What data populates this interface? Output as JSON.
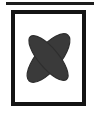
{
  "figure": {
    "title": "",
    "caption": "",
    "background_color": "#ffffff",
    "top_rule": {
      "name": "horizontal-rule",
      "color": "#1c1c1c",
      "x": 6,
      "y": 2,
      "width": 88,
      "height": 3
    },
    "frame": {
      "name": "icon-frame",
      "border_color": "#141414",
      "border_width": 4,
      "fill": "#ffffff",
      "x": 11,
      "y": 10,
      "width": 75,
      "height": 96
    },
    "icon": {
      "name": "cross-ellipses-icon",
      "description": "four-pointed cross formed by two overlapping rotated ellipses",
      "fill": "#3a3a3a",
      "stroke": "#2e2e2e",
      "center_x": 48,
      "center_y": 57,
      "ellipses": [
        {
          "label": "ellipse-nw-se",
          "cx": 48,
          "cy": 57,
          "rx": 12,
          "ry": 30,
          "rotation_deg": 40
        },
        {
          "label": "ellipse-ne-sw",
          "cx": 48,
          "cy": 57,
          "rx": 10,
          "ry": 28,
          "rotation_deg": -40
        }
      ]
    }
  }
}
